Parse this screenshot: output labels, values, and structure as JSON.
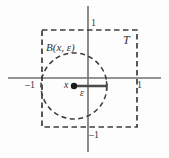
{
  "figure": {
    "kind": "math-diagram",
    "colors": {
      "background": "#fdfdfd",
      "axis": "#6f6f73",
      "dashed": "#3c3c3c",
      "circle": "#3c3c3c",
      "radius": "#4a4a4a",
      "point": "#1c1c1c",
      "text": "#333333"
    },
    "axes": {
      "x_axis_name": "horizontal-axis",
      "y_axis_name": "vertical-axis",
      "x_from": [
        8,
        78
      ],
      "x_to": [
        161,
        78
      ],
      "y_from": [
        88,
        6
      ],
      "y_to": [
        88,
        152
      ]
    },
    "square": {
      "label": "T",
      "left": 42,
      "top": 30,
      "right": 137,
      "bottom": 127,
      "style": "dashed"
    },
    "ball": {
      "label": "B(x, ε)",
      "center_x": 74,
      "center_y": 86,
      "radius": 33,
      "style": "dashed"
    },
    "point": {
      "label": "x",
      "x": 74,
      "y": 86
    },
    "radius_segment": {
      "label": "ε",
      "from_x": 74,
      "to_x": 107,
      "y": 86
    },
    "tick_labels": {
      "top": "1",
      "bottom": "–1",
      "left": "–1",
      "right": "1"
    }
  }
}
